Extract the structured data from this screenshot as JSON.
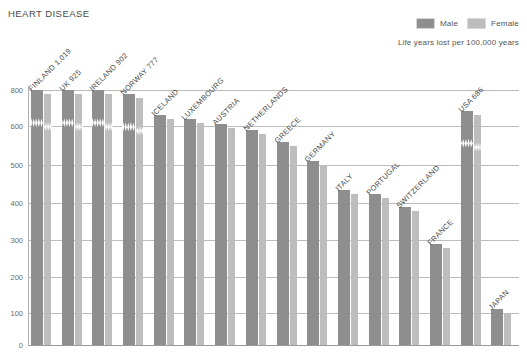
{
  "title": "HEART DISEASE",
  "legend": {
    "items": [
      {
        "label": "Male",
        "color": "#8e8e8e"
      },
      {
        "label": "Female",
        "color": "#bdbdbd"
      }
    ],
    "subtitle": "Life years lost per 100,000 years"
  },
  "chart_data": {
    "type": "bar",
    "title": "HEART DISEASE",
    "xlabel": "",
    "ylabel": "Life years lost per 100,000 years",
    "ylim": [
      0,
      800
    ],
    "axis_break": {
      "from": 600,
      "to": 800,
      "note": "scale break between 600 and 800"
    },
    "grid": true,
    "legend_position": "top-right",
    "ytick_labels": [
      "0",
      "100",
      "200",
      "300",
      "400",
      "500",
      "600",
      "800"
    ],
    "yticks": [
      0,
      100,
      200,
      300,
      400,
      500,
      600,
      800
    ],
    "categories": [
      "FINLAND",
      "UK",
      "IRELAND",
      "NORWAY",
      "ICELAND",
      "LUXEMBOURG",
      "AUSTRIA",
      "NETHERLANDS",
      "GREECE",
      "GERMANY",
      "ITALY",
      "PORTUGAL",
      "SWITZERLAND",
      "FRANCE",
      "USA",
      "JAPAN"
    ],
    "annotations": [
      {
        "category": "FINLAND",
        "text": "FINLAND 1,019",
        "value": 1019
      },
      {
        "category": "UK",
        "text": "UK 925",
        "value": 925
      },
      {
        "category": "IRELAND",
        "text": "IRELAND 902",
        "value": 902
      },
      {
        "category": "NORWAY",
        "text": "NORWAY 777",
        "value": 777
      },
      {
        "category": "USA",
        "text": "USA 686",
        "value": 686
      }
    ],
    "series": [
      {
        "name": "Male",
        "color": "#8e8e8e",
        "values": [
          1019,
          925,
          902,
          777,
          660,
          640,
          610,
          590,
          560,
          510,
          435,
          425,
          390,
          290,
          686,
          110
        ]
      },
      {
        "name": "Female",
        "color": "#bdbdbd",
        "values": [
          1019,
          925,
          902,
          777,
          660,
          640,
          610,
          590,
          560,
          510,
          435,
          425,
          390,
          290,
          686,
          110
        ]
      }
    ],
    "bars": [
      {
        "label": "FINLAND 1,019",
        "category": "FINLAND",
        "male": 1019,
        "female": 1019,
        "broken": true
      },
      {
        "label": "UK 925",
        "category": "UK",
        "male": 925,
        "female": 925,
        "broken": true
      },
      {
        "label": "IRELAND 902",
        "category": "IRELAND",
        "male": 902,
        "female": 902,
        "broken": true
      },
      {
        "label": "NORWAY 777",
        "category": "NORWAY",
        "male": 777,
        "female": 777,
        "broken": true
      },
      {
        "label": "ICELAND",
        "category": "ICELAND",
        "male": 660,
        "female": 660,
        "broken": false
      },
      {
        "label": "LUXEMBOURG",
        "category": "LUXEMBOURG",
        "male": 640,
        "female": 640,
        "broken": false
      },
      {
        "label": "AUSTRIA",
        "category": "AUSTRIA",
        "male": 610,
        "female": 610,
        "broken": false
      },
      {
        "label": "NETHERLANDS",
        "category": "NETHERLANDS",
        "male": 590,
        "female": 590,
        "broken": false
      },
      {
        "label": "GREECE",
        "category": "GREECE",
        "male": 560,
        "female": 560,
        "broken": false
      },
      {
        "label": "GERMANY",
        "category": "GERMANY",
        "male": 510,
        "female": 510,
        "broken": false
      },
      {
        "label": "ITALY",
        "category": "ITALY",
        "male": 435,
        "female": 435,
        "broken": false
      },
      {
        "label": "PORTUGAL",
        "category": "PORTUGAL",
        "male": 425,
        "female": 425,
        "broken": false
      },
      {
        "label": "SWITZERLAND",
        "category": "SWITZERLAND",
        "male": 390,
        "female": 390,
        "broken": false
      },
      {
        "label": "FRANCE",
        "category": "FRANCE",
        "male": 290,
        "female": 290,
        "broken": false
      },
      {
        "label": "USA 686",
        "category": "USA",
        "male": 686,
        "female": 686,
        "broken": true
      },
      {
        "label": "JAPAN",
        "category": "JAPAN",
        "male": 110,
        "female": 110,
        "broken": false
      }
    ]
  },
  "colors": {
    "male": "#8e8e8e",
    "female": "#bdbdbd",
    "gridline": "#bcbcbc",
    "axis": "#9a9a9a",
    "text": "#4a4a4a",
    "background": "#ffffff"
  }
}
